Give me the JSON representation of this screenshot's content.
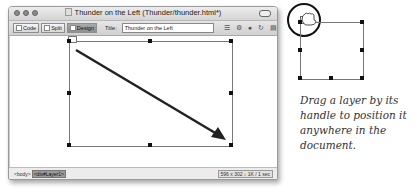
{
  "window": {
    "title": "Thunder on the Left (Thunder/thunder.html*)"
  },
  "toolbar": {
    "code_label": "Code",
    "split_label": "Split",
    "design_label": "Design",
    "title_label": "Title:",
    "title_value": "Thunder on the Left",
    "icons": [
      "file-management-icon",
      "preview-icon",
      "globe-check-icon",
      "refresh-icon",
      "view-options-icon"
    ]
  },
  "status": {
    "tag_body": "<body>",
    "tag_layer": "<div#Layer1>",
    "window_size": "596 x 302 ↓ 1K / 1 sec"
  },
  "illustration": {
    "caption": "Drag a layer by its handle to position it anywhere in the document."
  }
}
